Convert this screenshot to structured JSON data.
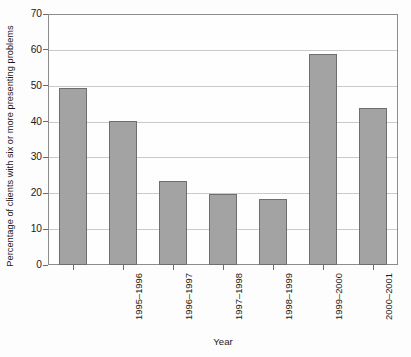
{
  "chart_data": {
    "type": "bar",
    "title": "",
    "xlabel": "Year",
    "ylabel": "Percentage of clients with six or more presenting problems",
    "categories": [
      "1995–1996",
      "1996–1997",
      "1997–1998",
      "1998–1999",
      "1999–2000",
      "2000–2001",
      "2001–2002"
    ],
    "values": [
      49.3,
      40.3,
      23.5,
      19.7,
      18.4,
      58.8,
      43.7
    ],
    "ylim": [
      0,
      70
    ],
    "yticks": [
      0,
      10,
      20,
      30,
      40,
      50,
      60,
      70
    ],
    "ytick_labels": [
      "0",
      "10",
      "20",
      "30",
      "40",
      "50",
      "60",
      "70"
    ],
    "grid": true,
    "legend": false,
    "legend_position": "none",
    "colors": {
      "bar_fill": "#a3a3a3",
      "bar_edge": "#6e6e6e",
      "gridline": "#c9c9c9",
      "frame": "#8c8c8c",
      "background": "#fdfdfd",
      "text": "#1a1a1a"
    }
  }
}
